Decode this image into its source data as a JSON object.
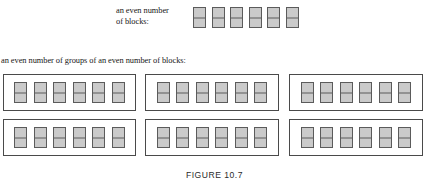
{
  "figure": {
    "caption": "FIGURE 10.7",
    "top_label": "an even number\nof blocks:",
    "middle_caption": "an even number of groups of an even number of blocks:",
    "colors": {
      "block_fill": "#c9c9c9",
      "block_border": "#5b5b5b",
      "box_border": "#4a4a4a",
      "text": "#161616",
      "background": "#ffffff"
    },
    "top_blocks": {
      "count": 6,
      "items": [
        {
          "label": "block-1"
        },
        {
          "label": "block-2"
        },
        {
          "label": "block-3"
        },
        {
          "label": "block-4"
        },
        {
          "label": "block-5"
        },
        {
          "label": "block-6"
        }
      ]
    },
    "groups": {
      "rows": 2,
      "columns": 3,
      "blocks_per_group": 6,
      "boxes": [
        {
          "name": "group-1",
          "blocks": [
            {
              "label": "block-1"
            },
            {
              "label": "block-2"
            },
            {
              "label": "block-3"
            },
            {
              "label": "block-4"
            },
            {
              "label": "block-5"
            },
            {
              "label": "block-6"
            }
          ]
        },
        {
          "name": "group-2",
          "blocks": [
            {
              "label": "block-1"
            },
            {
              "label": "block-2"
            },
            {
              "label": "block-3"
            },
            {
              "label": "block-4"
            },
            {
              "label": "block-5"
            },
            {
              "label": "block-6"
            }
          ]
        },
        {
          "name": "group-3",
          "blocks": [
            {
              "label": "block-1"
            },
            {
              "label": "block-2"
            },
            {
              "label": "block-3"
            },
            {
              "label": "block-4"
            },
            {
              "label": "block-5"
            },
            {
              "label": "block-6"
            }
          ]
        },
        {
          "name": "group-4",
          "blocks": [
            {
              "label": "block-1"
            },
            {
              "label": "block-2"
            },
            {
              "label": "block-3"
            },
            {
              "label": "block-4"
            },
            {
              "label": "block-5"
            },
            {
              "label": "block-6"
            }
          ]
        },
        {
          "name": "group-5",
          "blocks": [
            {
              "label": "block-1"
            },
            {
              "label": "block-2"
            },
            {
              "label": "block-3"
            },
            {
              "label": "block-4"
            },
            {
              "label": "block-5"
            },
            {
              "label": "block-6"
            }
          ]
        },
        {
          "name": "group-6",
          "blocks": [
            {
              "label": "block-1"
            },
            {
              "label": "block-2"
            },
            {
              "label": "block-3"
            },
            {
              "label": "block-4"
            },
            {
              "label": "block-5"
            },
            {
              "label": "block-6"
            }
          ]
        }
      ]
    }
  }
}
